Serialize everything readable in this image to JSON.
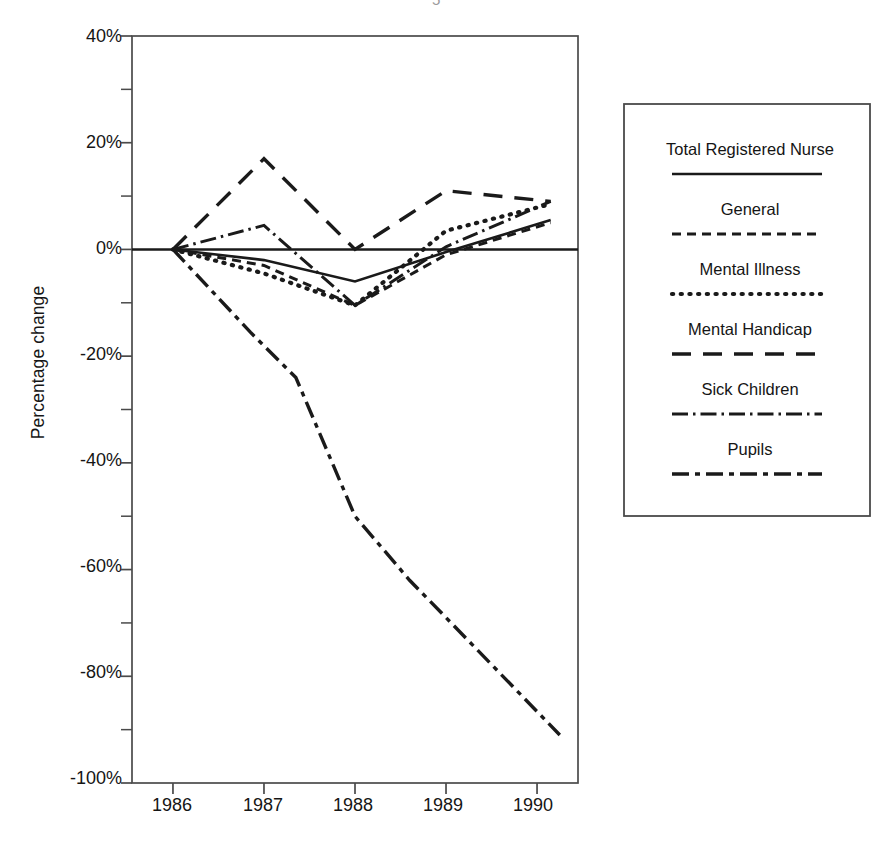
{
  "figure": {
    "width": 890,
    "height": 857,
    "background": "#ffffff",
    "ink_color": "#1a1a1a"
  },
  "chart_data": {
    "type": "line",
    "title": "",
    "xlabel": "",
    "ylabel": "Percentage change",
    "x": [
      1986,
      1987,
      1988,
      1989,
      1990
    ],
    "xtick_labels": [
      "1986",
      "1987",
      "1988",
      "1989",
      "1990"
    ],
    "ytick_labels": [
      "40%",
      "20%",
      "0%",
      "-20%",
      "-40%",
      "-60%",
      "-80%",
      "-100%"
    ],
    "ytick_values": [
      40,
      20,
      0,
      -20,
      -40,
      -60,
      -80,
      -100
    ],
    "yminor_values": [
      30,
      10,
      -10,
      -30,
      -50,
      -70,
      -90
    ],
    "ylim": [
      -100,
      40
    ],
    "xlim": [
      1985.55,
      1990.45
    ],
    "grid": false,
    "legend_position": "right-outside",
    "zero_line": true,
    "series": [
      {
        "name": "Total Registered Nurse",
        "style": "solid",
        "x": [
          1986,
          1987,
          1988,
          1989,
          1990.15
        ],
        "values": [
          0,
          -2.0,
          -6.0,
          -0.5,
          5.5
        ]
      },
      {
        "name": "General",
        "style": "dashed-short",
        "x": [
          1986,
          1987,
          1988,
          1989,
          1990.15
        ],
        "values": [
          0,
          -3.0,
          -10.5,
          -1.0,
          5.0
        ]
      },
      {
        "name": "Mental Illness",
        "style": "dotted",
        "x": [
          1986,
          1987,
          1988,
          1989,
          1990.15
        ],
        "values": [
          0,
          -4.5,
          -10.5,
          3.5,
          8.5
        ]
      },
      {
        "name": "Mental Handicap",
        "style": "dashed-long",
        "x": [
          1986,
          1987,
          1988,
          1989,
          1990.15
        ],
        "values": [
          0,
          17.0,
          0.0,
          11.0,
          9.0
        ]
      },
      {
        "name": "Sick Children",
        "style": "dash-dot-short",
        "x": [
          1986,
          1987,
          1988,
          1989,
          1990.15
        ],
        "values": [
          0,
          4.5,
          -10.5,
          0.5,
          9.0
        ]
      },
      {
        "name": "Pupils",
        "style": "dash-dot-long",
        "x": [
          1986,
          1986.85,
          1987.35,
          1988,
          1988.6,
          1989,
          1990.25
        ],
        "values": [
          0,
          -15.5,
          -24.0,
          -50.0,
          -62.0,
          -69.0,
          -91.0
        ]
      }
    ]
  },
  "legend": {
    "entries": [
      {
        "label": "Total Registered Nurse",
        "style": "solid"
      },
      {
        "label": "General",
        "style": "dashed-short"
      },
      {
        "label": "Mental Illness",
        "style": "dotted"
      },
      {
        "label": "Mental Handicap",
        "style": "dashed-long"
      },
      {
        "label": "Sick Children",
        "style": "dash-dot-short"
      },
      {
        "label": "Pupils",
        "style": "dash-dot-long"
      }
    ]
  },
  "artifact": {
    "top_mark": "5"
  }
}
